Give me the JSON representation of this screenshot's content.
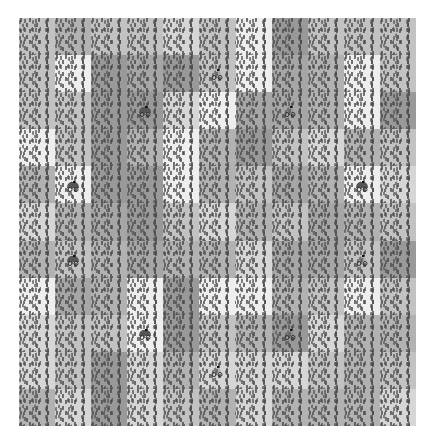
{
  "board": {
    "columns": 11,
    "rows": 11,
    "shade_colors": {
      "white": "#eeeeee",
      "light": "#d6d6d6",
      "midlight": "#c2c2c2",
      "mid": "#b2b2b2",
      "middark": "#a6a6a6",
      "dark": "#999999"
    },
    "tiles": [
      [
        "midlight",
        "mid",
        "midlight",
        "midlight",
        "light",
        "midlight",
        "white",
        "dark",
        "midlight",
        "midlight",
        "midlight"
      ],
      [
        "midlight",
        "white",
        "dark",
        "middark",
        "dark",
        "midlight",
        "white",
        "middark",
        "mid",
        "white",
        "midlight"
      ],
      [
        "midlight",
        "midlight",
        "dark",
        "dark",
        "light",
        "white",
        "middark",
        "middark",
        "mid",
        "white",
        "dark"
      ],
      [
        "white",
        "midlight",
        "dark",
        "mid",
        "white",
        "mid",
        "dark",
        "midlight",
        "light",
        "mid",
        "midlight"
      ],
      [
        "mid",
        "white",
        "dark",
        "dark",
        "white",
        "mid",
        "midlight",
        "middark",
        "mid",
        "white",
        "light"
      ],
      [
        "light",
        "mid",
        "middark",
        "dark",
        "midlight",
        "light",
        "mid",
        "midlight",
        "middark",
        "mid",
        "midlight"
      ],
      [
        "mid",
        "midlight",
        "mid",
        "middark",
        "mid",
        "mid",
        "light",
        "middark",
        "middark",
        "midlight",
        "dark"
      ],
      [
        "white",
        "middark",
        "mid",
        "white",
        "dark",
        "white",
        "white",
        "mid",
        "midlight",
        "white",
        "midlight"
      ],
      [
        "light",
        "midlight",
        "midlight",
        "white",
        "dark",
        "midlight",
        "mid",
        "dark",
        "light",
        "mid",
        "mid"
      ],
      [
        "light",
        "midlight",
        "dark",
        "light",
        "mid",
        "light",
        "light",
        "light",
        "midlight",
        "mid",
        "midlight"
      ],
      [
        "mid",
        "light",
        "dark",
        "light",
        "midlight",
        "mid",
        "light",
        "mid",
        "mid",
        "mid",
        "light"
      ]
    ],
    "cars": [
      {
        "col": 5,
        "row": 1,
        "style": "outline"
      },
      {
        "col": 3,
        "row": 2,
        "style": "filled"
      },
      {
        "col": 7,
        "row": 2,
        "style": "outline"
      },
      {
        "col": 1,
        "row": 4,
        "style": "filled"
      },
      {
        "col": 9,
        "row": 4,
        "style": "filled"
      },
      {
        "col": 1,
        "row": 6,
        "style": "filled"
      },
      {
        "col": 9,
        "row": 6,
        "style": "outline"
      },
      {
        "col": 3,
        "row": 8,
        "style": "filled"
      },
      {
        "col": 7,
        "row": 8,
        "style": "outline"
      },
      {
        "col": 5,
        "row": 9,
        "style": "outline"
      }
    ],
    "car_icon": "car-icon",
    "car_color": "#555555"
  }
}
